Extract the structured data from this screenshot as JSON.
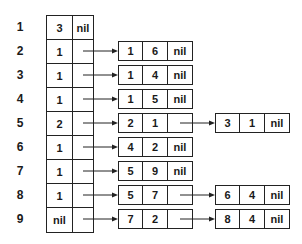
{
  "diagram": {
    "type": "linked-list-table",
    "rows": [
      {
        "label": "1",
        "head": [
          "3",
          "nil"
        ],
        "nodes": []
      },
      {
        "label": "2",
        "head": [
          "1",
          ""
        ],
        "nodes": [
          [
            "1",
            "6",
            "nil"
          ]
        ]
      },
      {
        "label": "3",
        "head": [
          "1",
          ""
        ],
        "nodes": [
          [
            "1",
            "4",
            "nil"
          ]
        ]
      },
      {
        "label": "4",
        "head": [
          "1",
          ""
        ],
        "nodes": [
          [
            "1",
            "5",
            "nil"
          ]
        ]
      },
      {
        "label": "5",
        "head": [
          "2",
          ""
        ],
        "nodes": [
          [
            "2",
            "1",
            ""
          ],
          [
            "3",
            "1",
            "nil"
          ]
        ]
      },
      {
        "label": "6",
        "head": [
          "1",
          ""
        ],
        "nodes": [
          [
            "4",
            "2",
            "nil"
          ]
        ]
      },
      {
        "label": "7",
        "head": [
          "1",
          ""
        ],
        "nodes": [
          [
            "5",
            "9",
            "nil"
          ]
        ]
      },
      {
        "label": "8",
        "head": [
          "1",
          ""
        ],
        "nodes": [
          [
            "5",
            "7",
            ""
          ],
          [
            "6",
            "4",
            "nil"
          ]
        ]
      },
      {
        "label": "9",
        "head": [
          "nil",
          ""
        ],
        "nodes": [
          [
            "7",
            "2",
            ""
          ],
          [
            "8",
            "4",
            "nil"
          ]
        ]
      }
    ],
    "colors": {
      "line": "#222222",
      "text": "#1a1a1a",
      "background": "#ffffff"
    }
  }
}
